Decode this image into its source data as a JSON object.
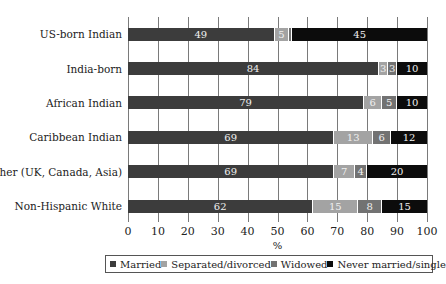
{
  "chart_data": {
    "type": "bar",
    "orientation": "horizontal",
    "stacked": true,
    "title": "",
    "xlabel": "%",
    "ylabel": "",
    "xlim": [
      0,
      100
    ],
    "x_ticks": [
      "0",
      "10",
      "20",
      "30",
      "40",
      "50",
      "60",
      "70",
      "80",
      "90",
      "100"
    ],
    "grid": "vertical",
    "legend_position": "bottom",
    "categories": [
      "US-born Indian",
      "India-born",
      "African Indian",
      "Caribbean Indian",
      "Other (UK, Canada, Asia)",
      "Non-Hispanic White"
    ],
    "series": [
      {
        "name": "Married",
        "color": "#3c3c3c",
        "values": [
          49,
          84,
          79,
          69,
          69,
          62
        ]
      },
      {
        "name": "Separated/divorced",
        "color": "#a3a3a3",
        "values": [
          5,
          3,
          6,
          13,
          7,
          15
        ]
      },
      {
        "name": "Widowed",
        "color": "#727272",
        "values": [
          1,
          3,
          5,
          6,
          4,
          8
        ]
      },
      {
        "name": "Never married/single",
        "color": "#0c0c0c",
        "values": [
          45,
          10,
          10,
          12,
          20,
          15
        ]
      }
    ],
    "data_labels": [
      [
        "49",
        "5",
        "",
        "45"
      ],
      [
        "84",
        "3",
        "3",
        "10"
      ],
      [
        "79",
        "6",
        "5",
        "10"
      ],
      [
        "69",
        "13",
        "6",
        "12"
      ],
      [
        "69",
        "7",
        "4",
        "20"
      ],
      [
        "62",
        "15",
        "8",
        "15"
      ]
    ]
  }
}
